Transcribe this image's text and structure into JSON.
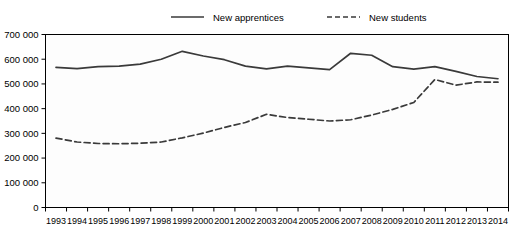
{
  "chart_data": {
    "type": "line",
    "title": "",
    "xlabel": "",
    "ylabel": "",
    "grid": false,
    "legend_position": "top-center",
    "x": [
      1993,
      1994,
      1995,
      1996,
      1997,
      1998,
      1999,
      2000,
      2001,
      2002,
      2003,
      2004,
      2005,
      2006,
      2007,
      2008,
      2009,
      2010,
      2011,
      2012,
      2013,
      2014
    ],
    "categories": [
      "1993",
      "1994",
      "1995",
      "1996",
      "1997",
      "1998",
      "1999",
      "2000",
      "2001",
      "2002",
      "2003",
      "2004",
      "2005",
      "2006",
      "2007",
      "2008",
      "2009",
      "2010",
      "2011",
      "2012",
      "2013",
      "2014"
    ],
    "ylim": [
      0,
      700000
    ],
    "yticks": [
      0,
      100000,
      200000,
      300000,
      400000,
      500000,
      600000,
      700000
    ],
    "ytick_labels": [
      "0",
      "100 000",
      "200 000",
      "300 000",
      "400 000",
      "500 000",
      "600 000",
      "700 000"
    ],
    "series": [
      {
        "name": "New apprentices",
        "style": "solid",
        "color": "#3a3a3a",
        "values": [
          567000,
          562000,
          570000,
          572000,
          580000,
          600000,
          632000,
          613000,
          598000,
          572000,
          561000,
          572000,
          565000,
          558000,
          624000,
          616000,
          570000,
          560000,
          570000,
          551000,
          530000,
          521000
        ]
      },
      {
        "name": "New students",
        "style": "dashed",
        "color": "#3a3a3a",
        "values": [
          281000,
          265000,
          259000,
          258000,
          260000,
          265000,
          282000,
          301000,
          324000,
          344000,
          377000,
          364000,
          357000,
          350000,
          355000,
          374000,
          397000,
          425000,
          518000,
          495000,
          508000,
          507000
        ]
      }
    ]
  },
  "legend": {
    "items": [
      {
        "label": "New apprentices",
        "style": "solid"
      },
      {
        "label": "New students",
        "style": "dashed"
      }
    ]
  }
}
